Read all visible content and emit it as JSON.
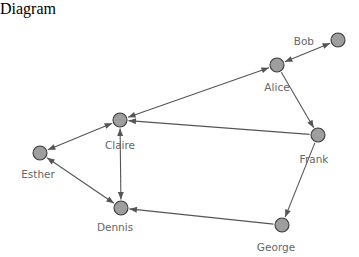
{
  "diagram": {
    "type": "directed-network-graph",
    "title": "",
    "background_color": "#ffffff",
    "node_fill_color": "#9e9e9e",
    "node_stroke_color": "#3a3a3a",
    "edge_color": "#555555",
    "label_color": "#666666",
    "width": 359,
    "height": 250,
    "node_radius": 7,
    "nodes": [
      {
        "id": "bob",
        "label": "Bob",
        "x": 338,
        "y": 22,
        "label_x": 314,
        "label_y": 27,
        "label_anchor": "end"
      },
      {
        "id": "alice",
        "label": "Alice",
        "x": 277,
        "y": 47,
        "label_x": 277,
        "label_y": 73,
        "label_anchor": "middle"
      },
      {
        "id": "claire",
        "label": "Claire",
        "x": 120,
        "y": 102,
        "label_x": 120,
        "label_y": 131,
        "label_anchor": "middle"
      },
      {
        "id": "esther",
        "label": "Esther",
        "x": 40,
        "y": 135,
        "label_x": 38,
        "label_y": 160,
        "label_anchor": "middle"
      },
      {
        "id": "frank",
        "label": "Frank",
        "x": 318,
        "y": 117,
        "label_x": 314,
        "label_y": 145,
        "label_anchor": "middle"
      },
      {
        "id": "dennis",
        "label": "Dennis",
        "x": 121,
        "y": 190,
        "label_x": 115,
        "label_y": 213,
        "label_anchor": "middle"
      },
      {
        "id": "george",
        "label": "George",
        "x": 282,
        "y": 207,
        "label_x": 276,
        "label_y": 233,
        "label_anchor": "middle"
      }
    ],
    "edges": [
      {
        "source": "alice",
        "target": "bob",
        "directed": "both"
      },
      {
        "source": "alice",
        "target": "claire",
        "directed": "both"
      },
      {
        "source": "alice",
        "target": "frank",
        "directed": "forward"
      },
      {
        "source": "frank",
        "target": "claire",
        "directed": "forward"
      },
      {
        "source": "frank",
        "target": "george",
        "directed": "forward"
      },
      {
        "source": "claire",
        "target": "esther",
        "directed": "both"
      },
      {
        "source": "claire",
        "target": "dennis",
        "directed": "both"
      },
      {
        "source": "esther",
        "target": "dennis",
        "directed": "both"
      },
      {
        "source": "george",
        "target": "dennis",
        "directed": "forward"
      }
    ]
  }
}
